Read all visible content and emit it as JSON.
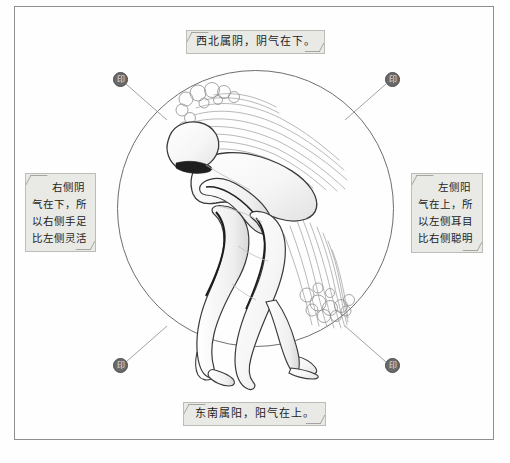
{
  "figure": {
    "title_visible": false
  },
  "frame": {
    "border_color": "#8e8e8e",
    "background": "#fefefe"
  },
  "circle": {
    "stroke_color": "#6f6f6f"
  },
  "captions": {
    "top": "西北属阴，阴气在下。",
    "bottom": "东南属阳，阳气在上。",
    "left": "右侧阴气在下，所以右侧手足比左侧灵活",
    "right": "左侧阳气在上，所以左侧耳目比右侧聪明",
    "background": "#e9e9e6",
    "border_color": "#bdbdb8",
    "text_color": "#1d1d1d"
  },
  "seals": {
    "top_left": "印",
    "top_right": "印",
    "bottom_left": "印",
    "bottom_right": "印",
    "fill_color": "#6a6a6a"
  },
  "artwork": {
    "line_color": "#4a4a4a",
    "qi_color": "#9a9a9a",
    "body_fill": "#fbfbfb"
  }
}
